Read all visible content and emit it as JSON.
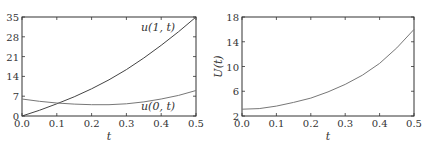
{
  "chart_data": [
    {
      "type": "line",
      "title": "",
      "xlabel": "t",
      "ylabel": "",
      "xlim": [
        0.0,
        0.5
      ],
      "ylim": [
        0,
        35
      ],
      "xticks": [
        "0.0",
        "0.1",
        "0.2",
        "0.3",
        "0.4",
        "0.5"
      ],
      "yticks": [
        "0",
        "7",
        "14",
        "21",
        "28",
        "35"
      ],
      "grid": false,
      "x": [
        0.0,
        0.05,
        0.1,
        0.15,
        0.2,
        0.25,
        0.3,
        0.35,
        0.4,
        0.45,
        0.5
      ],
      "series": [
        {
          "name": "u(1, t)",
          "color": "#444444",
          "values": [
            0,
            2.0,
            4.3,
            6.8,
            9.6,
            12.8,
            16.4,
            20.5,
            25.0,
            29.8,
            35.0
          ]
        },
        {
          "name": "u(0, t)",
          "color": "#777777",
          "values": [
            6.0,
            5.2,
            4.6,
            4.2,
            4.0,
            4.0,
            4.3,
            5.0,
            6.0,
            7.3,
            9.0
          ]
        }
      ],
      "annotations": [
        {
          "text": "u(1, t)",
          "x": 0.44,
          "y": 30
        },
        {
          "text": "u(0, t)",
          "x": 0.44,
          "y": 2
        }
      ]
    },
    {
      "type": "line",
      "title": "",
      "xlabel": "t",
      "ylabel": "U(t)",
      "xlim": [
        0.0,
        0.5
      ],
      "ylim": [
        2,
        18
      ],
      "xticks": [
        "0.0",
        "0.1",
        "0.2",
        "0.3",
        "0.4",
        "0.5"
      ],
      "yticks": [
        "2",
        "6",
        "10",
        "14",
        "18"
      ],
      "grid": false,
      "x": [
        0.0,
        0.05,
        0.1,
        0.15,
        0.2,
        0.25,
        0.3,
        0.35,
        0.4,
        0.45,
        0.5
      ],
      "series": [
        {
          "name": "U(t)",
          "color": "#777777",
          "values": [
            3.1,
            3.2,
            3.6,
            4.2,
            4.9,
            5.9,
            7.1,
            8.6,
            10.5,
            13.0,
            16.0
          ]
        }
      ]
    }
  ]
}
